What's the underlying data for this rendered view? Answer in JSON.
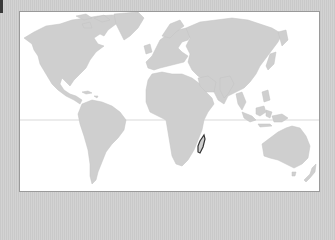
{
  "map": {
    "type": "world-map",
    "projection": "equirectangular-like",
    "highlighted_country": "Madagascar",
    "colors": {
      "background": "#cdcdcd",
      "ocean": "#ffffff",
      "land": "#cfcfcf",
      "highlight_outline": "#333333",
      "frame_border": "#9a9a9a",
      "corner_strip": "#3a3a3a"
    },
    "features": {
      "equator_line": true,
      "frame": true
    }
  }
}
